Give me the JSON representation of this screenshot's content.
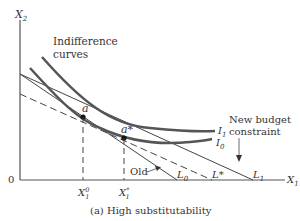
{
  "diagram": {
    "caption": "(a) High substitutability",
    "axes": {
      "y_label": "X",
      "y_sub": "2",
      "x_label": "X",
      "x_sub": "1",
      "origin": "0"
    },
    "annotations": {
      "indifference_line1": "Indifference",
      "indifference_line2": "curves",
      "new_budget_line1": "New budget",
      "new_budget_line2": "constraint",
      "old": "Old"
    },
    "curve_labels": {
      "I1": "I",
      "I1_sub": "1",
      "I0": "I",
      "I0_sub": "0"
    },
    "points": {
      "a": "a",
      "a_star": "a*"
    },
    "x_ticks": {
      "x10": "X",
      "x10_sup": "0",
      "x10_sub": "1",
      "x1s": "X",
      "x1s_sup": "*",
      "x1s_sub": "1"
    },
    "intercepts": {
      "L0": "L",
      "L0_sub": "0",
      "Lstar": "L*",
      "L1": "L",
      "L1_sub": "1"
    }
  }
}
